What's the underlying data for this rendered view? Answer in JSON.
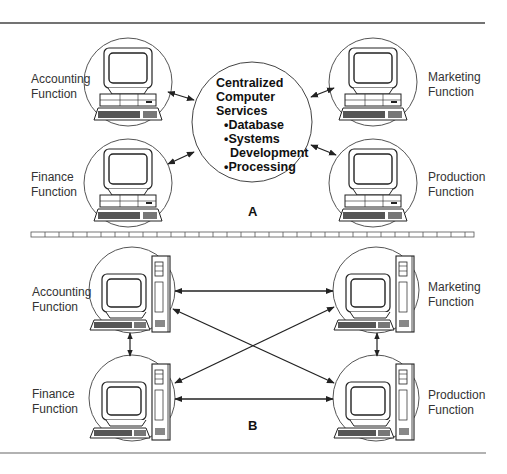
{
  "diagram": {
    "section_a": {
      "label": "A",
      "center": {
        "title_lines": [
          "Centralized",
          "Computer",
          "Services"
        ],
        "bullets": [
          "•Database",
          "•Systems",
          "Development",
          "•Processing"
        ]
      },
      "nodes": [
        {
          "line1": "Accounting",
          "line2": "Function"
        },
        {
          "line1": "Finance",
          "line2": "Function"
        },
        {
          "line1": "Marketing",
          "line2": "Function"
        },
        {
          "line1": "Production",
          "line2": "Function"
        }
      ]
    },
    "section_b": {
      "label": "B",
      "nodes": [
        {
          "line1": "Accounting",
          "line2": "Function"
        },
        {
          "line1": "Finance",
          "line2": "Function"
        },
        {
          "line1": "Marketing",
          "line2": "Function"
        },
        {
          "line1": "Production",
          "line2": "Function"
        }
      ]
    },
    "colors": {
      "line": "#222222",
      "rule": "#555555",
      "background": "#ffffff"
    }
  }
}
